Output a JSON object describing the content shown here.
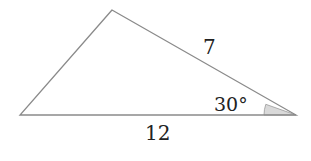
{
  "diagram": {
    "type": "triangle",
    "vertices": {
      "top": [
        112,
        10
      ],
      "bottom_left": [
        20,
        115
      ],
      "bottom_right": [
        296,
        115
      ]
    },
    "labels": {
      "side_right": "7",
      "side_bottom": "12",
      "angle": "30°"
    },
    "colors": {
      "stroke": "#8a8a8a",
      "angle_fill": "#d9d9d9"
    }
  }
}
